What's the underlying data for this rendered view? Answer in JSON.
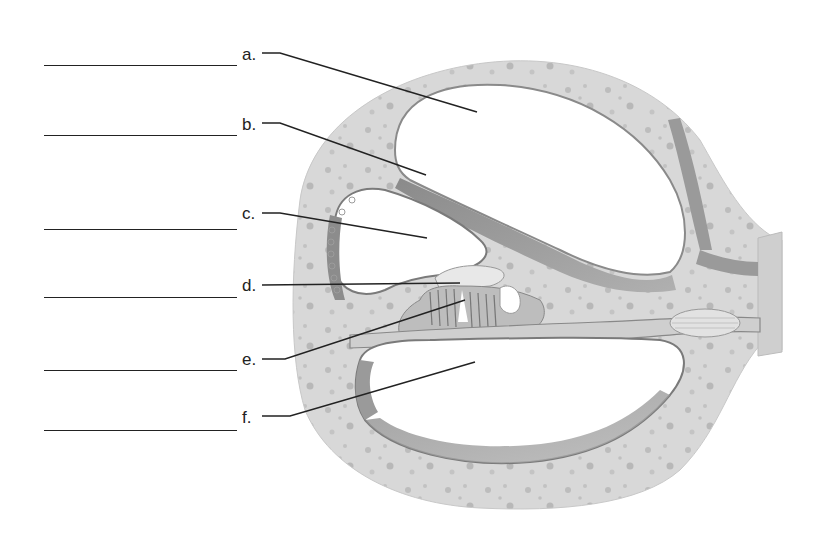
{
  "diagram": {
    "labels": [
      {
        "id": "a",
        "text": "a.",
        "blank_y": 65,
        "label_x": 242,
        "label_y": 48
      },
      {
        "id": "b",
        "text": "b.",
        "blank_y": 135,
        "label_x": 242,
        "label_y": 118
      },
      {
        "id": "c",
        "text": "c.",
        "blank_y": 229,
        "label_x": 242,
        "label_y": 206
      },
      {
        "id": "d",
        "text": "d.",
        "blank_y": 297,
        "label_x": 242,
        "label_y": 278
      },
      {
        "id": "e",
        "text": "e.",
        "blank_y": 370,
        "label_x": 242,
        "label_y": 352
      },
      {
        "id": "f",
        "text": "f.",
        "blank_y": 430,
        "label_x": 242,
        "label_y": 412
      }
    ]
  },
  "colors": {
    "bone": "#d6d6d6",
    "bone_speckle": "#b9b9b9",
    "membrane": "#9a9a9a",
    "dark_tissue": "#7e7e7e",
    "line": "#222222",
    "background": "#ffffff"
  }
}
